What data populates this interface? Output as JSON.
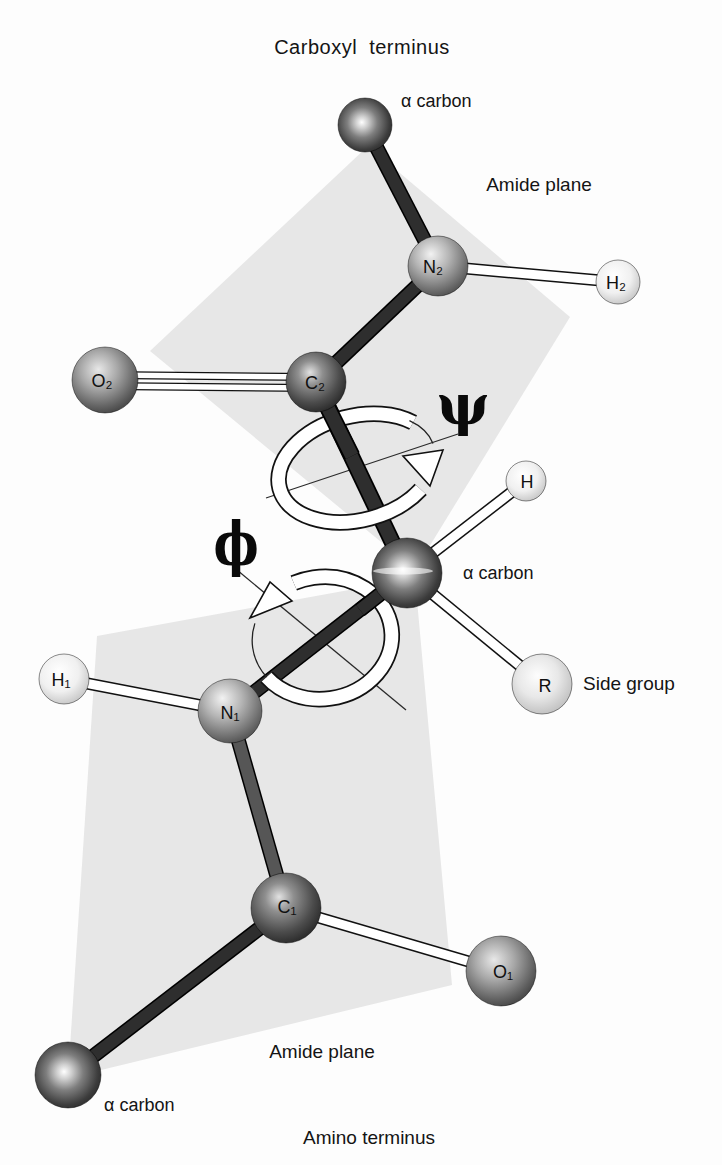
{
  "diagram": {
    "top_caption": "Carboxyl terminus",
    "bottom_caption": "Amino terminus",
    "annotations": {
      "alpha_top": "α carbon",
      "alpha_mid": "α carbon",
      "alpha_bottom": "α carbon",
      "amide_top": "Amide plane",
      "amide_bottom": "Amide plane",
      "side_group": "Side group",
      "psi": "ψ",
      "phi": "ϕ"
    },
    "atom_labels": {
      "n2": "N₂",
      "h2": "H₂",
      "o2": "O₂",
      "c2": "C₂",
      "h": "H",
      "r": "R",
      "h1": "H₁",
      "n1": "N₁",
      "c1": "C₁",
      "o1": "O₁"
    },
    "colors": {
      "background": "#fdfdfd",
      "plane": "#e7e7e7",
      "bond_dark": "#2e2e2e",
      "bond_medium": "#565656",
      "bond_white": "#ffffff",
      "text": "#141414"
    }
  }
}
